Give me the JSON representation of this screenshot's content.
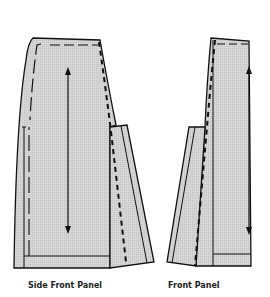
{
  "diagram": {
    "type": "sewing-pattern-pieces",
    "colors": {
      "fill": "#d2d2d2",
      "stroke": "#111111",
      "background": "#ffffff"
    },
    "pieces": [
      {
        "id": "side-front-panel",
        "label": "Side Front Panel",
        "grainline": "vertical double-headed arrow",
        "markings": [
          "seam line (dashed)",
          "hem fold line",
          "pleat/flap extension",
          "bold dashed stitch line"
        ]
      },
      {
        "id": "front-panel",
        "label": "Front Panel",
        "grainline": "vertical double-headed arrow on right edge",
        "markings": [
          "seam line (dashed)",
          "hem fold line",
          "pleat/flap extension",
          "bold dashed stitch line"
        ]
      }
    ]
  }
}
